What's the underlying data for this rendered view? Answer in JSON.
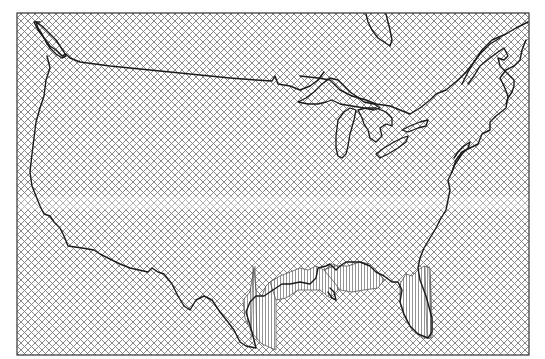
{
  "map": {
    "title": "",
    "region": "Contiguous United States",
    "fill_pattern": "diagonal cross-hatch",
    "colors": {
      "background": "#ffffff",
      "hatch": "#7a7a7a",
      "outline": "#1a1a1a",
      "frame": "#333333"
    },
    "features": [
      {
        "name": "us-border-outline",
        "kind": "coastline-and-border"
      },
      {
        "name": "great-lakes",
        "kind": "lakes"
      },
      {
        "name": "gulf-coast-artifact-texas",
        "kind": "vertical-hatch-artifact"
      },
      {
        "name": "gulf-coast-artifact-louisiana",
        "kind": "vertical-hatch-artifact"
      },
      {
        "name": "florida-artifact",
        "kind": "vertical-hatch-artifact"
      },
      {
        "name": "horizontal-light-band",
        "kind": "rendering-artifact"
      }
    ]
  }
}
